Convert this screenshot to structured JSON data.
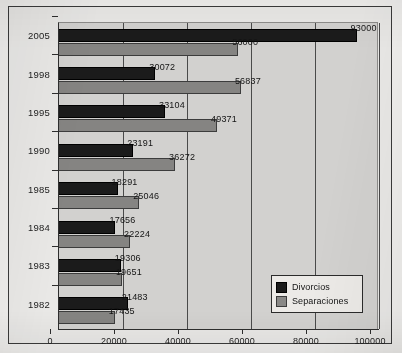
{
  "chart_data": {
    "type": "bar",
    "orientation": "horizontal",
    "title": "",
    "xlabel": "",
    "ylabel": "",
    "xlim": [
      0,
      100000
    ],
    "xticks": [
      "0",
      "20000",
      "40000",
      "60000",
      "80000",
      "100000"
    ],
    "grid": "vertical",
    "legend_position": "bottom-right-inside",
    "categories": [
      "2005",
      "1998",
      "1995",
      "1990",
      "1985",
      "1984",
      "1983",
      "1982"
    ],
    "series": [
      {
        "name": "Divorcios",
        "color": "#1b1b1b",
        "values": [
          93000,
          30072,
          33104,
          23191,
          18291,
          17656,
          19306,
          21483
        ],
        "labels": [
          "93000",
          "30072",
          "33104",
          "23191",
          "18291",
          "17656",
          "19306",
          "21483"
        ]
      },
      {
        "name": "Separaciones",
        "color": "#858482",
        "values": [
          56000,
          56837,
          49371,
          36272,
          25046,
          22224,
          19651,
          17435
        ],
        "labels": [
          "56000",
          "56837",
          "49371",
          "36272",
          "25046",
          "22224",
          "19651",
          "17435"
        ]
      }
    ]
  },
  "legend": {
    "entries": [
      {
        "label": "Divorcios",
        "color": "#1b1b1b"
      },
      {
        "label": "Separaciones",
        "color": "#858482"
      }
    ]
  },
  "colors": {
    "divorcios": "#1b1b1b",
    "separaciones": "#858482",
    "plot_background": "#d2d1cf",
    "page_background": "#e9e8e6",
    "axis": "#2e2e2e"
  }
}
